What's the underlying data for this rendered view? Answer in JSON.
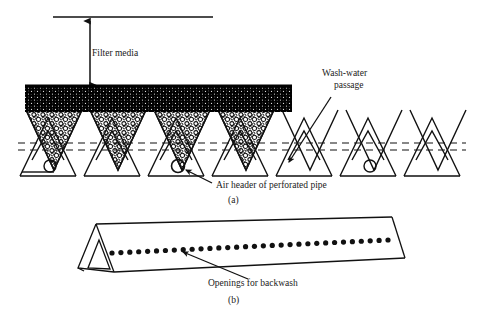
{
  "figure": {
    "title_alt": "Filter underdrain V-trough block diagram",
    "background_color": "#ffffff",
    "ink_color": "#111111"
  },
  "panel_a": {
    "caption": "(a)",
    "caption_x": 228,
    "caption_y": 202,
    "labels": {
      "filter_media": {
        "text": "Filter media",
        "x": 92,
        "y": 56
      },
      "wash_water_line1": {
        "text": "Wash-water",
        "x": 322,
        "y": 76
      },
      "wash_water_line2": {
        "text": "passage",
        "x": 334,
        "y": 88
      },
      "air_header": {
        "text": "Air header of perforated pipe",
        "x": 216,
        "y": 187
      }
    },
    "water_surface_line": {
      "x1": 53,
      "x2": 213,
      "y": 17
    },
    "depth_arrow": {
      "x": 90,
      "y_top": 18,
      "y_bottom": 88
    },
    "media_band": {
      "x_left": 25,
      "x_right": 292,
      "y_top": 85,
      "y_bottom": 112,
      "color": "#000000"
    },
    "troughs": {
      "count": 7,
      "pitch": 64,
      "start_x": 18,
      "peak_y": 118,
      "valley_y": 168,
      "base_y": 176,
      "gravel_filled_indices": [
        0,
        1,
        2
      ],
      "dashed_y_upper": 143,
      "dashed_y_lower": 149
    },
    "pipe_circles": [
      {
        "cx": 50,
        "cy": 166,
        "r": 6
      },
      {
        "cx": 178,
        "cy": 166,
        "r": 6.5
      },
      {
        "cx": 370,
        "cy": 166,
        "r": 6
      }
    ],
    "wash_water_arrow": {
      "x1": 331,
      "y1": 97,
      "x2": 287,
      "y2": 164
    },
    "air_header_arrow": {
      "x1": 211,
      "y1": 182,
      "x2": 187,
      "y2": 170
    }
  },
  "panel_b": {
    "caption": "(b)",
    "caption_x": 228,
    "caption_y": 300,
    "label_openings": {
      "text": "Openings for backwash",
      "x": 208,
      "y": 285
    },
    "openings": {
      "count": 32,
      "x_start": 112,
      "x_end": 388,
      "y_start": 253,
      "y_end": 240,
      "radius": 2.6
    },
    "pointer_arrow": {
      "x1": 247,
      "y1": 280,
      "x2": 182,
      "y2": 251
    },
    "prism": {
      "apex_left_x": 96,
      "apex_left_y": 224,
      "apex_right_x": 392,
      "apex_right_y": 217,
      "front_bottom_left_x": 114,
      "front_bottom_left_y": 272,
      "front_bottom_right_x": 405,
      "front_bottom_right_y": 258,
      "back_bottom_left_x": 78,
      "back_bottom_left_y": 268
    }
  }
}
